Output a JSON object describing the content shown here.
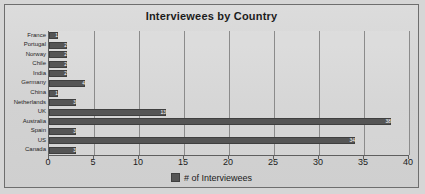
{
  "chart_data": {
    "type": "bar",
    "orientation": "horizontal",
    "title": "Interviewees by Country",
    "xlabel": "",
    "ylabel": "",
    "xlim": [
      0,
      40
    ],
    "xticks": [
      0,
      5,
      10,
      15,
      20,
      25,
      30,
      35,
      40
    ],
    "grid": true,
    "legend": [
      "# of Interviewees"
    ],
    "legend_position": "bottom",
    "series_name": "# of Interviewees",
    "bar_color": "#555555",
    "categories": [
      "France",
      "Portugal",
      "Norway",
      "Chile",
      "India",
      "Germany",
      "China",
      "Netherlands",
      "UK",
      "Australia",
      "Spain",
      "US",
      "Canada"
    ],
    "values": [
      1,
      2,
      2,
      2,
      2,
      4,
      1,
      3,
      13,
      38,
      3,
      34,
      3
    ]
  },
  "legend_label": "# of Interviewees"
}
